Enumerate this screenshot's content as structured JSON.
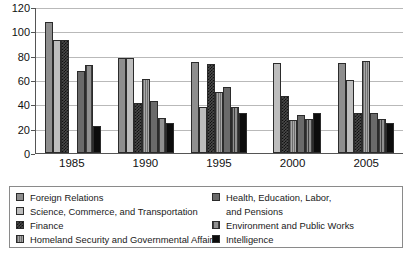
{
  "chart_data": {
    "type": "bar",
    "title": "",
    "xlabel": "",
    "ylabel": "",
    "categories": [
      "1985",
      "1990",
      "1995",
      "2000",
      "2005"
    ],
    "ylim": [
      0,
      120
    ],
    "yticks": [
      0,
      20,
      40,
      60,
      80,
      100,
      120
    ],
    "grid": true,
    "legend_position": "bottom",
    "series": [
      {
        "name": "Foreign Relations",
        "color": "#8e8e8e",
        "values": [
          108,
          78,
          75,
          null,
          74
        ]
      },
      {
        "name": "Science, Commerce, and Transportation",
        "color": "#bdbdbd",
        "values": [
          93,
          78,
          38,
          74,
          60
        ]
      },
      {
        "name": "Finance",
        "color": "#4a4a4a",
        "values": [
          93,
          41,
          73,
          47,
          33
        ]
      },
      {
        "name": "Homeland Security and Governmental Affairs",
        "color": "#a8a8a8",
        "values": [
          null,
          61,
          50,
          27,
          76
        ]
      },
      {
        "name": "Health, Education, Labor, and Pensions",
        "color": "#6a6a6a",
        "values": [
          67,
          43,
          54,
          31,
          33
        ]
      },
      {
        "name": "Environment and Public Works",
        "color": "#909090",
        "values": [
          72,
          29,
          38,
          28,
          28
        ]
      },
      {
        "name": "Intelligence",
        "color": "#0c0c0c",
        "values": [
          22,
          25,
          33,
          33,
          25
        ]
      }
    ]
  },
  "legend": {
    "left_column": [
      {
        "label": "Foreign Relations",
        "series_index": 0
      },
      {
        "label": "Science, Commerce, and Transportation",
        "series_index": 1
      },
      {
        "label": "Finance",
        "series_index": 2
      },
      {
        "label": "Homeland Security and Governmental Affairs",
        "series_index": 3
      }
    ],
    "right_column": [
      {
        "label": "Health, Education, Labor,",
        "series_index": 4
      },
      {
        "label": "and Pensions",
        "series_index": -1
      },
      {
        "label": "Environment and Public Works",
        "series_index": 5
      },
      {
        "label": "Intelligence",
        "series_index": 6
      }
    ]
  }
}
